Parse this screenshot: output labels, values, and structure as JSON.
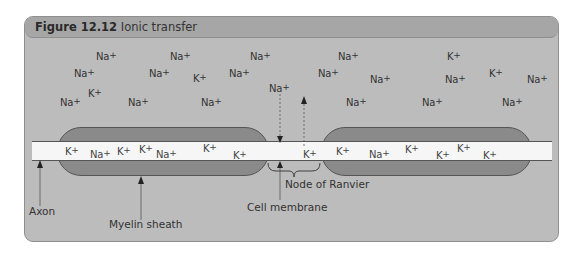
{
  "figure": {
    "number": "Figure 12.12",
    "title": "Ionic transfer"
  },
  "colors": {
    "panel_bg": "#bcbcbc",
    "header_bg": "#a6a6a6",
    "myelin": "#8a8a8a",
    "axon": "#f6f6f6"
  },
  "ions_outside": [
    {
      "label": "Na",
      "charge": "+",
      "x": 96,
      "y": 50
    },
    {
      "label": "Na",
      "charge": "+",
      "x": 170,
      "y": 50
    },
    {
      "label": "Na",
      "charge": "+",
      "x": 250,
      "y": 50
    },
    {
      "label": "Na",
      "charge": "+",
      "x": 74,
      "y": 67
    },
    {
      "label": "Na",
      "charge": "+",
      "x": 149,
      "y": 67
    },
    {
      "label": "K",
      "charge": "+",
      "x": 193,
      "y": 72
    },
    {
      "label": "Na",
      "charge": "+",
      "x": 229,
      "y": 67
    },
    {
      "label": "K",
      "charge": "+",
      "x": 88,
      "y": 87
    },
    {
      "label": "Na",
      "charge": "+",
      "x": 60,
      "y": 96
    },
    {
      "label": "Na",
      "charge": "+",
      "x": 128,
      "y": 96
    },
    {
      "label": "Na",
      "charge": "+",
      "x": 201,
      "y": 96
    },
    {
      "label": "Na",
      "charge": "+",
      "x": 269,
      "y": 82
    },
    {
      "label": "Na",
      "charge": "+",
      "x": 338,
      "y": 50
    },
    {
      "label": "K",
      "charge": "+",
      "x": 447,
      "y": 50
    },
    {
      "label": "Na",
      "charge": "+",
      "x": 318,
      "y": 67
    },
    {
      "label": "Na",
      "charge": "+",
      "x": 370,
      "y": 73
    },
    {
      "label": "Na",
      "charge": "+",
      "x": 445,
      "y": 73
    },
    {
      "label": "K",
      "charge": "+",
      "x": 489,
      "y": 67
    },
    {
      "label": "Na",
      "charge": "+",
      "x": 527,
      "y": 73
    },
    {
      "label": "Na",
      "charge": "+",
      "x": 346,
      "y": 96
    },
    {
      "label": "Na",
      "charge": "+",
      "x": 422,
      "y": 96
    },
    {
      "label": "Na",
      "charge": "+",
      "x": 502,
      "y": 96
    }
  ],
  "ions_inside": [
    {
      "label": "K",
      "charge": "+",
      "x": 65,
      "y": 145
    },
    {
      "label": "Na",
      "charge": "+",
      "x": 90,
      "y": 148
    },
    {
      "label": "K",
      "charge": "+",
      "x": 117,
      "y": 145
    },
    {
      "label": "K",
      "charge": "+",
      "x": 139,
      "y": 143
    },
    {
      "label": "Na",
      "charge": "+",
      "x": 156,
      "y": 148
    },
    {
      "label": "K",
      "charge": "+",
      "x": 203,
      "y": 142
    },
    {
      "label": "K",
      "charge": "+",
      "x": 233,
      "y": 149
    },
    {
      "label": "K",
      "charge": "+",
      "x": 303,
      "y": 148
    },
    {
      "label": "K",
      "charge": "+",
      "x": 336,
      "y": 145
    },
    {
      "label": "Na",
      "charge": "+",
      "x": 369,
      "y": 148
    },
    {
      "label": "K",
      "charge": "+",
      "x": 405,
      "y": 143
    },
    {
      "label": "K",
      "charge": "+",
      "x": 436,
      "y": 149
    },
    {
      "label": "K",
      "charge": "+",
      "x": 457,
      "y": 142
    },
    {
      "label": "K",
      "charge": "+",
      "x": 483,
      "y": 149
    }
  ],
  "labels": {
    "axon": "Axon",
    "myelin_sheath": "Myelin sheath",
    "cell_membrane": "Cell membrane",
    "node_of_ranvier": "Node of Ranvier"
  }
}
